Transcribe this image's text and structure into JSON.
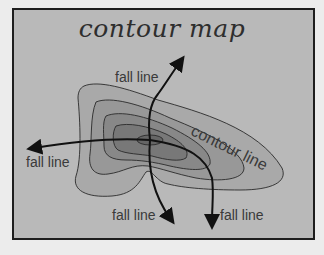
{
  "diagram": {
    "title": "contour map",
    "labels": {
      "fall_line_top": "fall line",
      "fall_line_left": "fall line",
      "fall_line_bottom_left": "fall line",
      "fall_line_bottom_right": "fall line",
      "contour_line": "contour line"
    },
    "colors": {
      "background": "#b9b9b9",
      "border": "#1e1e1e",
      "contour_1": "#a8a8a8",
      "contour_2": "#989898",
      "contour_3": "#888888",
      "contour_4": "#787878",
      "peak": "#666666",
      "line": "#111111"
    }
  }
}
